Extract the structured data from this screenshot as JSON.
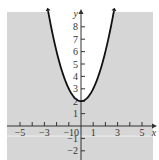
{
  "chart_data": {
    "type": "line",
    "title": "",
    "xlabel": "x",
    "ylabel": "y",
    "xlim": [
      -5.5,
      5.8
    ],
    "ylim": [
      -2.8,
      9.2
    ],
    "x_tick_labels": [
      "-5",
      "-3",
      "-1",
      "0",
      "1",
      "3",
      "5"
    ],
    "x_ticks": [
      -5,
      -4,
      -3,
      -2,
      -1,
      1,
      2,
      3,
      4,
      5
    ],
    "y_tick_labels": [
      "-2",
      "-1",
      "1",
      "2",
      "3",
      "4",
      "5",
      "6",
      "7",
      "8"
    ],
    "y_ticks": [
      -2,
      -1,
      1,
      2,
      3,
      4,
      5,
      6,
      7,
      8
    ],
    "series": [
      {
        "name": "y = x^2 + 2",
        "equation": "y = x^2 + 2",
        "x": [
          -2.65,
          -2,
          -1.5,
          -1,
          -0.5,
          0,
          0.5,
          1,
          1.5,
          2,
          2.65
        ],
        "values": [
          9.02,
          6,
          4.25,
          3,
          2.25,
          2,
          2.25,
          3,
          4.25,
          6,
          9.02
        ],
        "line_style": "solid",
        "color": "#111111"
      }
    ],
    "shaded_region": "y < x^2 + 2",
    "grid": false,
    "legend": "none"
  },
  "colors": {
    "shade": "#d6d6d6",
    "curve": "#111111",
    "axis": "#333333",
    "background": "#ffffff"
  },
  "labels": {
    "x_axis": "x",
    "y_axis": "y",
    "origin": "0"
  }
}
